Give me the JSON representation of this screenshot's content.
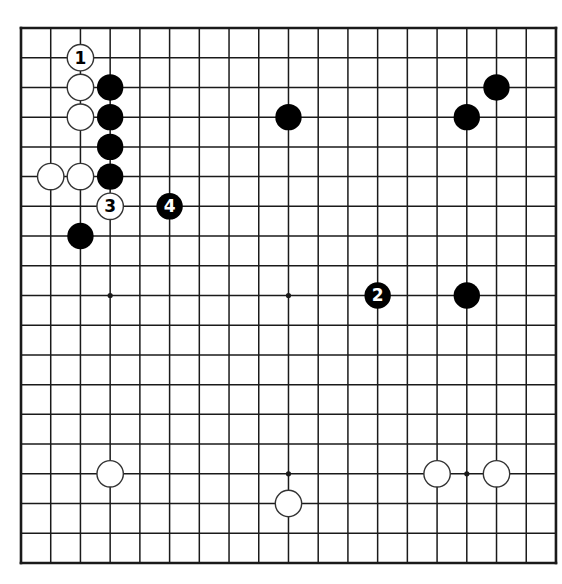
{
  "diagram": {
    "type": "go-board",
    "size": 19,
    "origin": {
      "x": 21,
      "y": 28
    },
    "spacing": 29.72,
    "stone_radius": 13.2,
    "star_radius": 2.6,
    "colors": {
      "background": "#ffffff",
      "line": "#1a1a1a",
      "black_stone": "#000000",
      "white_stone": "#ffffff",
      "white_outline": "#333333",
      "label_on_black": "#ffffff",
      "label_on_white": "#000000"
    },
    "star_points": [
      {
        "col": 3,
        "row": 3
      },
      {
        "col": 9,
        "row": 3
      },
      {
        "col": 15,
        "row": 3
      },
      {
        "col": 3,
        "row": 9
      },
      {
        "col": 9,
        "row": 9
      },
      {
        "col": 15,
        "row": 9
      },
      {
        "col": 3,
        "row": 15
      },
      {
        "col": 9,
        "row": 15
      },
      {
        "col": 15,
        "row": 15
      }
    ],
    "stones": [
      {
        "color": "white",
        "col": 2,
        "row": 1,
        "label": "1"
      },
      {
        "color": "white",
        "col": 2,
        "row": 2,
        "label": ""
      },
      {
        "color": "white",
        "col": 2,
        "row": 3,
        "label": ""
      },
      {
        "color": "white",
        "col": 1,
        "row": 5,
        "label": ""
      },
      {
        "color": "white",
        "col": 2,
        "row": 5,
        "label": ""
      },
      {
        "color": "white",
        "col": 3,
        "row": 6,
        "label": "3"
      },
      {
        "color": "black",
        "col": 3,
        "row": 2,
        "label": ""
      },
      {
        "color": "black",
        "col": 3,
        "row": 3,
        "label": ""
      },
      {
        "color": "black",
        "col": 3,
        "row": 4,
        "label": ""
      },
      {
        "color": "black",
        "col": 3,
        "row": 5,
        "label": ""
      },
      {
        "color": "black",
        "col": 5,
        "row": 6,
        "label": "4"
      },
      {
        "color": "black",
        "col": 2,
        "row": 7,
        "label": ""
      },
      {
        "color": "black",
        "col": 9,
        "row": 3,
        "label": ""
      },
      {
        "color": "black",
        "col": 16,
        "row": 2,
        "label": ""
      },
      {
        "color": "black",
        "col": 15,
        "row": 3,
        "label": ""
      },
      {
        "color": "black",
        "col": 12,
        "row": 9,
        "label": "2"
      },
      {
        "color": "black",
        "col": 15,
        "row": 9,
        "label": ""
      },
      {
        "color": "white",
        "col": 3,
        "row": 15,
        "label": ""
      },
      {
        "color": "white",
        "col": 9,
        "row": 16,
        "label": ""
      },
      {
        "color": "white",
        "col": 14,
        "row": 15,
        "label": ""
      },
      {
        "color": "white",
        "col": 16,
        "row": 15,
        "label": ""
      }
    ]
  }
}
